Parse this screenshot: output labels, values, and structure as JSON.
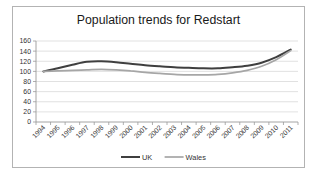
{
  "window": {
    "background": "#ffffff",
    "chart_border_color": "#b3b3b3"
  },
  "chart_data": {
    "type": "line",
    "title": "Population trends for Redstart",
    "categories": [
      "1994",
      "1995",
      "1996",
      "1997",
      "1998",
      "1999",
      "2000",
      "2001",
      "2002",
      "2003",
      "2004",
      "2005",
      "2006",
      "2007",
      "2008",
      "2009",
      "2010",
      "2011"
    ],
    "series": [
      {
        "name": "UK",
        "color": "#3f3f3f",
        "stroke_width": 2.0,
        "values": [
          100,
          106,
          113,
          119,
          120,
          118,
          115,
          112,
          110,
          108,
          107,
          106,
          106,
          108,
          111,
          117,
          128,
          143
        ]
      },
      {
        "name": "Wales",
        "color": "#a6a6a6",
        "stroke_width": 1.7,
        "values": [
          100,
          101,
          102,
          103,
          104,
          103,
          101,
          98,
          96,
          94,
          93,
          93,
          94,
          97,
          102,
          110,
          123,
          141
        ]
      }
    ],
    "ylim": [
      0,
      160
    ],
    "ytick_step": 20,
    "ytick_labels": [
      "0",
      "20",
      "40",
      "60",
      "80",
      "100",
      "120",
      "140",
      "160"
    ],
    "grid": true,
    "smoothed": true,
    "legend_position": "bottom-center",
    "colors": {
      "grid": "#d9d9d9",
      "axis": "#9a9a9a",
      "tick": "#9a9a9a",
      "axis_text": "#333333",
      "title_text": "#1a1a1a"
    }
  }
}
